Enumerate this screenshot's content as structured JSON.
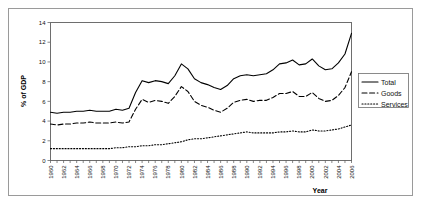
{
  "chart_data": {
    "type": "line",
    "title": "",
    "xlabel": "Year",
    "ylabel": "% of GDP",
    "xlim": [
      1960,
      2006
    ],
    "ylim": [
      0,
      14
    ],
    "ytick_step": 2,
    "xtick_step": 2,
    "grid": true,
    "legend_position": "right",
    "yticks": [
      "0",
      "2",
      "4",
      "6",
      "8",
      "10",
      "12",
      "14"
    ],
    "xticks": [
      "1960",
      "1962",
      "1964",
      "1966",
      "1968",
      "1970",
      "1972",
      "1974",
      "1976",
      "1978",
      "1980",
      "1982",
      "1984",
      "1986",
      "1988",
      "1990",
      "1992",
      "1994",
      "1996",
      "1998",
      "2000",
      "2002",
      "2004",
      "2006"
    ],
    "x": [
      1960,
      1961,
      1962,
      1963,
      1964,
      1965,
      1966,
      1967,
      1968,
      1969,
      1970,
      1971,
      1972,
      1973,
      1974,
      1975,
      1976,
      1977,
      1978,
      1979,
      1980,
      1981,
      1982,
      1983,
      1984,
      1985,
      1986,
      1987,
      1988,
      1989,
      1990,
      1991,
      1992,
      1993,
      1994,
      1995,
      1996,
      1997,
      1998,
      1999,
      2000,
      2001,
      2002,
      2003,
      2004,
      2005,
      2006
    ],
    "series": [
      {
        "name": "Total",
        "style": "solid",
        "color": "#000000",
        "values": [
          4.9,
          4.8,
          4.9,
          4.9,
          5.0,
          5.0,
          5.1,
          5.0,
          5.0,
          5.0,
          5.2,
          5.1,
          5.3,
          6.9,
          8.1,
          7.9,
          8.1,
          8.0,
          7.8,
          8.6,
          9.8,
          9.3,
          8.3,
          7.9,
          7.7,
          7.4,
          7.2,
          7.6,
          8.3,
          8.6,
          8.7,
          8.6,
          8.7,
          8.8,
          9.2,
          9.8,
          9.9,
          10.2,
          9.7,
          9.8,
          10.3,
          9.6,
          9.2,
          9.3,
          9.9,
          10.8,
          12.9
        ]
      },
      {
        "name": "Goods",
        "style": "dashed",
        "color": "#000000",
        "values": [
          3.7,
          3.6,
          3.7,
          3.7,
          3.8,
          3.8,
          3.9,
          3.8,
          3.8,
          3.8,
          3.9,
          3.8,
          3.9,
          5.2,
          6.2,
          5.9,
          6.1,
          6.0,
          5.8,
          6.5,
          7.5,
          7.0,
          6.0,
          5.6,
          5.4,
          5.1,
          4.9,
          5.3,
          5.9,
          6.1,
          6.2,
          6.0,
          6.1,
          6.1,
          6.4,
          6.8,
          6.8,
          7.0,
          6.5,
          6.5,
          6.9,
          6.3,
          6.0,
          6.1,
          6.6,
          7.4,
          9.0
        ]
      },
      {
        "name": "Services",
        "style": "dotted",
        "color": "#000000",
        "values": [
          1.2,
          1.2,
          1.2,
          1.2,
          1.2,
          1.2,
          1.2,
          1.2,
          1.2,
          1.2,
          1.3,
          1.3,
          1.4,
          1.4,
          1.5,
          1.5,
          1.6,
          1.6,
          1.7,
          1.8,
          1.9,
          2.1,
          2.2,
          2.2,
          2.3,
          2.4,
          2.5,
          2.6,
          2.7,
          2.8,
          2.9,
          2.8,
          2.8,
          2.8,
          2.8,
          2.9,
          2.9,
          3.0,
          2.9,
          2.9,
          3.1,
          3.0,
          3.0,
          3.1,
          3.2,
          3.4,
          3.6
        ]
      }
    ],
    "legend": [
      {
        "label": "Total",
        "style": "solid"
      },
      {
        "label": "Goods",
        "style": "dashed"
      },
      {
        "label": "Services",
        "style": "dotted"
      }
    ]
  }
}
